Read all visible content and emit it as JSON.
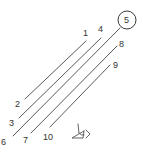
{
  "diagram": {
    "line_color": "#5a5a5a",
    "label_color": "#333333",
    "lines": [
      {
        "id": "1",
        "x1": 86,
        "y1": 41,
        "x2": 25,
        "y2": 99,
        "label": "1",
        "lx": 83,
        "ly": 36
      },
      {
        "id": "2",
        "x1": 86,
        "y1": 41,
        "x2": 25,
        "y2": 99,
        "label": "2",
        "lx": 15,
        "ly": 107
      },
      {
        "id": "3",
        "x1": 101,
        "y1": 38,
        "x2": 19,
        "y2": 118,
        "label": "3",
        "lx": 9,
        "ly": 126
      },
      {
        "id": "4",
        "x1": 101,
        "y1": 38,
        "x2": 19,
        "y2": 118,
        "label": "4",
        "lx": 98,
        "ly": 32
      },
      {
        "id": "5",
        "x1": 120,
        "y1": 28,
        "x2": 13,
        "y2": 136,
        "label": "5",
        "lx": 124,
        "ly": 23
      },
      {
        "id": "6",
        "x1": 120,
        "y1": 28,
        "x2": 13,
        "y2": 136,
        "label": "6",
        "lx": 1,
        "ly": 145
      },
      {
        "id": "7",
        "x1": 117,
        "y1": 46,
        "x2": 31,
        "y2": 133,
        "label": "7",
        "lx": 23,
        "ly": 143
      },
      {
        "id": "8",
        "x1": 117,
        "y1": 46,
        "x2": 31,
        "y2": 133,
        "label": "8",
        "lx": 119,
        "ly": 47
      },
      {
        "id": "9",
        "x1": 110,
        "y1": 65,
        "x2": 50,
        "y2": 127,
        "label": "9",
        "lx": 113,
        "ly": 68
      },
      {
        "id": "10",
        "x1": 110,
        "y1": 65,
        "x2": 50,
        "y2": 127,
        "label": "10",
        "lx": 43,
        "ly": 140
      }
    ],
    "segments": [
      {
        "name": "line-1-2",
        "x1": 86,
        "y1": 41,
        "x2": 25,
        "y2": 99
      },
      {
        "name": "line-4-3",
        "x1": 101,
        "y1": 38,
        "x2": 19,
        "y2": 118
      },
      {
        "name": "line-5-6",
        "x1": 120,
        "y1": 28,
        "x2": 13,
        "y2": 136
      },
      {
        "name": "line-8-7",
        "x1": 117,
        "y1": 46,
        "x2": 31,
        "y2": 133
      },
      {
        "name": "line-9-10",
        "x1": 110,
        "y1": 65,
        "x2": 50,
        "y2": 127
      }
    ],
    "labels": {
      "l1": "1",
      "l2": "2",
      "l3": "3",
      "l4": "4",
      "l5": "5",
      "l6": "6",
      "l7": "7",
      "l8": "8",
      "l9": "9",
      "l10": "10"
    },
    "circled_label": {
      "text": "5",
      "cx": 127,
      "cy": 20,
      "r": 9
    },
    "eye_icon": {
      "name": "eye-icon",
      "x": 72,
      "y": 125
    }
  }
}
